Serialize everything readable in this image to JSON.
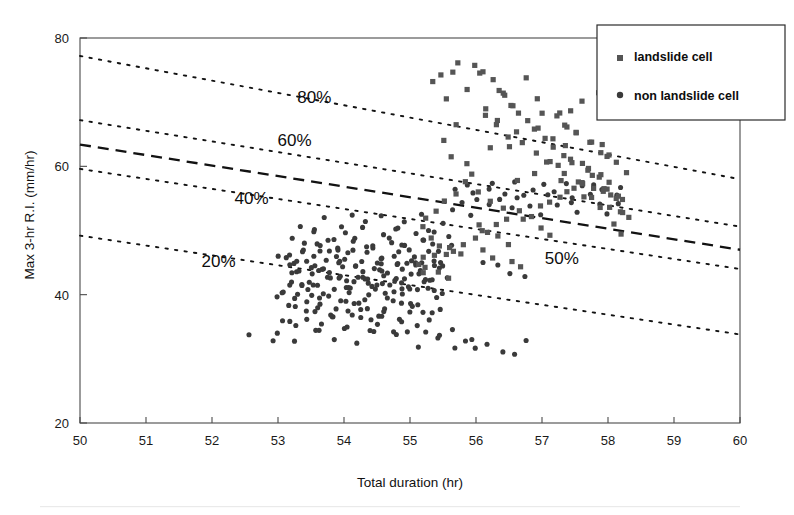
{
  "chart_data": {
    "type": "scatter",
    "title": "",
    "xlabel": "Total duration  (hr)",
    "ylabel": "Max 3-hr R.I.   (mm/hr)",
    "xlim": [
      50,
      60
    ],
    "ylim": [
      20,
      80
    ],
    "xticks": [
      50,
      51,
      52,
      53,
      54,
      55,
      56,
      57,
      58,
      59,
      60
    ],
    "yticks": [
      20,
      40,
      60,
      80
    ],
    "grid": false,
    "legend_position": "top-right",
    "series": [
      {
        "name": "landslide cell",
        "marker": "square",
        "color": "#555555"
      },
      {
        "name": "non landslide cell",
        "marker": "circle",
        "color": "#3a3a3a"
      }
    ],
    "annotations": [
      {
        "label": "80%",
        "x": 53.55,
        "y": 69.8,
        "line_style": "dotted",
        "line": {
          "x0": 50.0,
          "y0": 77.2,
          "x1": 60.0,
          "y1": 58.0
        }
      },
      {
        "label": "60%",
        "x": 53.25,
        "y": 63.2,
        "line_style": "dotted",
        "line": {
          "x0": 50.0,
          "y0": 67.2,
          "x1": 60.0,
          "y1": 50.6
        }
      },
      {
        "label": "50%",
        "x": 57.3,
        "y": 44.8,
        "line_style": "dashed",
        "line": {
          "x0": 50.0,
          "y0": 63.4,
          "x1": 60.0,
          "y1": 47.0
        }
      },
      {
        "label": "40%",
        "x": 52.6,
        "y": 54.2,
        "line_style": "dotted",
        "line": {
          "x0": 50.0,
          "y0": 59.6,
          "x1": 60.0,
          "y1": 44.0
        }
      },
      {
        "label": "20%",
        "x": 52.1,
        "y": 44.3,
        "line_style": "dotted",
        "line": {
          "x0": 50.0,
          "y0": 49.2,
          "x1": 60.0,
          "y1": 33.8
        }
      }
    ],
    "landslide_cell": {
      "x": [
        55.35,
        55.58,
        55.9,
        56.12,
        56.02,
        55.72,
        56.42,
        56.58,
        56.78,
        56.3,
        55.48,
        55.62,
        56.66,
        56.9,
        57.02,
        56.2,
        55.86,
        56.46,
        56.84,
        57.18,
        57.32,
        57.46,
        57.6,
        57.72,
        57.86,
        58.0,
        57.24,
        57.38,
        57.52,
        57.66,
        57.8,
        57.94,
        58.08,
        58.18,
        57.1,
        56.96,
        56.74,
        56.52,
        56.34,
        56.16,
        55.98,
        55.8,
        55.66,
        55.5,
        55.4,
        55.28,
        55.2,
        56.06,
        56.24,
        56.4,
        56.62,
        56.86,
        57.06,
        57.26,
        57.44,
        57.62,
        57.78,
        57.92,
        58.06,
        58.22,
        57.16,
        57.34,
        57.5,
        57.68,
        57.84,
        57.98,
        58.12,
        57.04,
        56.92,
        56.8,
        56.68,
        56.56,
        56.44,
        56.32,
        56.22,
        56.1,
        55.94,
        55.76,
        55.6,
        55.44,
        57.4,
        57.56,
        57.7,
        57.88,
        58.02,
        58.16,
        58.28,
        57.22,
        57.36,
        57.54,
        57.74,
        57.9,
        58.04,
        56.64,
        56.48,
        56.28,
        56.14,
        55.96,
        55.84,
        55.7,
        55.56,
        55.34,
        55.24,
        55.14,
        56.0,
        56.18,
        56.36,
        56.54,
        56.72,
        56.88,
        57.0,
        57.12,
        57.28,
        57.42,
        57.58,
        57.76,
        57.96,
        58.1,
        58.2,
        58.3,
        55.3,
        55.46,
        55.64,
        55.82,
        56.08,
        56.26,
        56.5,
        56.7,
        56.94,
        57.08,
        57.3,
        57.48,
        57.64,
        57.82,
        58.14,
        58.24,
        55.18,
        55.26,
        55.38,
        55.54
      ],
      "y": [
        73.1,
        70.6,
        72.4,
        68.9,
        74.1,
        66.8,
        71.2,
        69.4,
        73.6,
        67.2,
        64.1,
        61.9,
        65.8,
        70.1,
        68.3,
        62.6,
        60.4,
        63.2,
        66.1,
        64.4,
        62.8,
        61.2,
        60.1,
        59.2,
        58.4,
        57.6,
        59.8,
        58.6,
        57.8,
        57.0,
        56.4,
        55.9,
        55.2,
        54.6,
        61.0,
        62.2,
        63.8,
        65.0,
        66.4,
        67.6,
        58.8,
        57.2,
        55.6,
        54.2,
        52.8,
        51.6,
        50.4,
        56.2,
        55.0,
        53.8,
        57.4,
        59.0,
        60.6,
        58.2,
        56.8,
        55.4,
        54.8,
        54.0,
        53.4,
        52.6,
        63.4,
        62.0,
        60.8,
        59.6,
        58.0,
        56.6,
        55.8,
        64.6,
        65.8,
        67.0,
        68.2,
        69.6,
        70.8,
        72.0,
        73.2,
        74.4,
        75.6,
        76.2,
        75.0,
        73.8,
        66.2,
        64.8,
        63.6,
        62.4,
        61.4,
        60.2,
        59.4,
        67.8,
        66.6,
        65.4,
        64.2,
        63.0,
        61.8,
        53.2,
        52.0,
        50.8,
        49.6,
        48.8,
        48.0,
        47.2,
        46.6,
        46.0,
        45.4,
        44.8,
        51.2,
        50.0,
        49.0,
        48.2,
        51.4,
        52.4,
        53.6,
        54.4,
        55.2,
        56.0,
        57.6,
        58.4,
        56.2,
        54.8,
        53.0,
        51.8,
        48.4,
        47.6,
        47.0,
        46.4,
        46.8,
        45.8,
        45.2,
        44.6,
        50.2,
        49.4,
        68.4,
        69.0,
        70.2,
        71.4,
        50.6,
        49.8,
        43.8,
        44.2,
        43.4,
        42.8
      ]
    },
    "non_landslide_cell": {
      "x": [
        53.18,
        53.32,
        53.44,
        53.56,
        53.68,
        53.8,
        53.92,
        54.04,
        54.16,
        54.28,
        54.4,
        54.52,
        54.64,
        54.76,
        54.88,
        55.0,
        55.12,
        55.24,
        55.36,
        55.48,
        53.22,
        53.36,
        53.5,
        53.62,
        53.74,
        53.86,
        53.98,
        54.1,
        54.22,
        54.34,
        54.46,
        54.58,
        54.7,
        54.82,
        54.94,
        55.06,
        55.18,
        55.3,
        55.42,
        55.54,
        53.12,
        53.26,
        53.4,
        53.54,
        53.66,
        53.78,
        53.9,
        54.02,
        54.14,
        54.26,
        54.38,
        54.5,
        54.62,
        54.74,
        54.86,
        54.98,
        55.1,
        55.22,
        55.34,
        55.46,
        53.08,
        53.2,
        53.34,
        53.48,
        53.6,
        53.72,
        53.84,
        53.96,
        54.08,
        54.2,
        54.32,
        54.44,
        54.56,
        54.68,
        54.8,
        54.92,
        55.04,
        55.16,
        55.28,
        55.4,
        53.16,
        53.3,
        53.42,
        53.52,
        53.64,
        53.76,
        53.88,
        54.0,
        54.12,
        54.24,
        54.36,
        54.48,
        54.6,
        54.72,
        54.84,
        54.96,
        55.08,
        55.2,
        55.32,
        55.44,
        53.24,
        53.38,
        53.46,
        53.58,
        53.7,
        53.82,
        53.94,
        54.06,
        54.18,
        54.3,
        54.42,
        54.54,
        54.66,
        54.78,
        54.9,
        55.02,
        55.14,
        55.26,
        55.38,
        55.5,
        53.04,
        53.14,
        53.28,
        53.4,
        53.52,
        53.62,
        53.74,
        53.86,
        53.98,
        54.1,
        54.2,
        54.34,
        54.46,
        54.58,
        54.68,
        54.8,
        54.94,
        55.06,
        55.16,
        55.3,
        52.98,
        53.1,
        53.22,
        53.36,
        53.5,
        53.64,
        53.78,
        53.9,
        54.04,
        54.16,
        54.28,
        54.4,
        54.52,
        54.64,
        54.76,
        54.88,
        55.0,
        55.12,
        55.24,
        55.36,
        53.06,
        53.18,
        53.32,
        53.44,
        53.56,
        53.7,
        53.84,
        53.96,
        54.08,
        54.22,
        54.36,
        54.5,
        54.62,
        54.74,
        54.86,
        54.98,
        55.1,
        55.22,
        55.34,
        55.46,
        53.26,
        53.4,
        53.54,
        53.68,
        53.8,
        53.94,
        54.06,
        54.18,
        54.3,
        54.44,
        54.56,
        54.7,
        54.82,
        54.96,
        55.08,
        55.2,
        55.32,
        55.44,
        55.56,
        55.66,
        52.6,
        52.9,
        53.0,
        53.3,
        53.6,
        53.9,
        54.2,
        54.5,
        54.8,
        55.1,
        55.4,
        55.6,
        55.7,
        55.8,
        55.9,
        56.0,
        56.2,
        56.4,
        56.6,
        56.8,
        53.35,
        53.55,
        53.75,
        53.95,
        54.15,
        54.35,
        54.55,
        54.75,
        54.95,
        55.15,
        55.35,
        55.55,
        53.45,
        53.65,
        53.85,
        54.05,
        54.25,
        54.45,
        54.65,
        54.85,
        55.6,
        55.75,
        55.9,
        56.05,
        56.2,
        56.35,
        56.5,
        56.65,
        56.8,
        56.95,
        57.1,
        57.25,
        57.4,
        57.55,
        57.7,
        57.85,
        58.0,
        58.15,
        56.1,
        56.3,
        55.65,
        55.85,
        56.0,
        56.15,
        56.25,
        56.45,
        56.6,
        56.75,
        56.9,
        57.05,
        57.2,
        57.35,
        57.5,
        57.65,
        57.8,
        57.95,
        58.1,
        58.2,
        56.5,
        56.7
      ],
      "y": [
        44.6,
        43.8,
        45.2,
        42.9,
        44.1,
        43.2,
        45.6,
        42.4,
        44.8,
        43.6,
        42.2,
        44.4,
        43.0,
        45.0,
        41.8,
        43.4,
        44.2,
        42.6,
        45.4,
        43.9,
        42.1,
        43.3,
        41.6,
        44.0,
        42.8,
        45.8,
        43.1,
        41.4,
        44.5,
        42.3,
        45.1,
        43.7,
        41.2,
        44.9,
        42.7,
        45.3,
        43.5,
        41.9,
        44.7,
        42.5,
        46.2,
        45.0,
        46.8,
        44.3,
        46.4,
        45.5,
        47.0,
        43.9,
        46.6,
        45.2,
        47.2,
        44.1,
        46.0,
        45.8,
        47.4,
        44.6,
        46.3,
        45.4,
        47.6,
        44.8,
        40.8,
        41.5,
        40.2,
        41.0,
        39.8,
        40.6,
        41.2,
        39.4,
        40.4,
        41.8,
        39.0,
        40.9,
        41.6,
        39.6,
        40.1,
        41.3,
        38.8,
        40.7,
        41.1,
        39.2,
        38.4,
        37.8,
        38.9,
        37.2,
        38.1,
        36.9,
        37.6,
        38.6,
        36.4,
        37.4,
        38.2,
        36.6,
        37.9,
        38.8,
        36.2,
        37.1,
        38.3,
        36.8,
        37.5,
        38.0,
        43.4,
        42.0,
        44.2,
        41.6,
        43.8,
        42.4,
        44.6,
        41.2,
        43.0,
        42.8,
        44.0,
        41.8,
        43.6,
        42.2,
        44.4,
        41.0,
        43.2,
        42.6,
        44.8,
        40.6,
        45.8,
        46.6,
        45.4,
        47.2,
        46.0,
        47.8,
        46.4,
        48.2,
        45.6,
        46.8,
        48.6,
        46.2,
        47.4,
        45.9,
        48.0,
        46.5,
        47.6,
        45.1,
        48.4,
        46.9,
        39.6,
        40.4,
        39.2,
        41.4,
        40.0,
        41.8,
        39.4,
        42.2,
        40.8,
        39.0,
        42.6,
        40.2,
        41.0,
        39.8,
        42.4,
        40.5,
        41.2,
        38.6,
        42.0,
        40.9,
        35.8,
        36.2,
        35.2,
        36.6,
        34.8,
        35.6,
        36.4,
        34.4,
        35.4,
        36.0,
        34.2,
        35.0,
        36.8,
        34.6,
        35.9,
        33.8,
        35.5,
        34.0,
        36.3,
        33.4,
        49.0,
        48.0,
        49.4,
        47.8,
        48.8,
        47.4,
        49.8,
        48.4,
        50.2,
        47.6,
        49.2,
        48.6,
        50.6,
        47.2,
        49.6,
        48.2,
        50.0,
        47.0,
        48.9,
        47.5,
        33.8,
        33.2,
        34.2,
        32.8,
        34.6,
        33.0,
        32.4,
        34.0,
        33.6,
        32.2,
        33.4,
        34.8,
        31.8,
        32.6,
        33.1,
        31.4,
        32.0,
        31.0,
        30.6,
        32.9,
        51.0,
        50.4,
        51.6,
        50.8,
        52.0,
        51.2,
        52.4,
        50.6,
        51.8,
        52.2,
        50.2,
        51.4,
        37.0,
        38.4,
        36.5,
        37.8,
        38.7,
        36.1,
        37.3,
        38.5,
        53.4,
        54.2,
        52.8,
        55.0,
        53.8,
        54.6,
        53.2,
        55.4,
        54.0,
        52.6,
        55.8,
        53.6,
        54.8,
        53.0,
        55.2,
        54.4,
        52.4,
        53.9,
        45.2,
        44.4,
        56.2,
        57.0,
        55.6,
        56.8,
        57.4,
        56.0,
        57.8,
        55.8,
        56.6,
        57.2,
        56.4,
        57.6,
        55.4,
        56.9,
        57.1,
        56.3,
        55.1,
        56.7,
        43.6,
        42.8
      ]
    }
  },
  "legend": {
    "items": [
      {
        "label": "landslide cell",
        "marker": "square"
      },
      {
        "label": "non landslide cell",
        "marker": "circle"
      }
    ]
  },
  "axes": {
    "x_title": "Total duration  (hr)",
    "y_title": "Max 3-hr R.I.   (mm/hr)",
    "x_tick_labels": [
      "50",
      "51",
      "52",
      "53",
      "54",
      "55",
      "56",
      "57",
      "58",
      "59",
      "60"
    ],
    "y_tick_labels": [
      "20",
      "40",
      "60",
      "80"
    ]
  },
  "curve_labels": [
    "80%",
    "60%",
    "50%",
    "40%",
    "20%"
  ],
  "colors": {
    "landslide_marker": "#555555",
    "non_landslide_marker": "#3a3a3a",
    "line": "#121212",
    "frame": "#4a4a4a",
    "background": "#ffffff"
  }
}
